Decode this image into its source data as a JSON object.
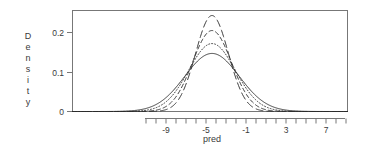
{
  "chart_data": {
    "type": "line",
    "title": "",
    "subtitle": "",
    "xlabel": "pred",
    "ylabel": "Density",
    "ylabel_letters": [
      "D",
      "e",
      "n",
      "s",
      "i",
      "t",
      "y"
    ],
    "xlim": [
      -12.5,
      15.1
    ],
    "ylim": [
      0,
      0.255
    ],
    "grid": false,
    "legend": null,
    "x_ticks_labeled": [
      -9,
      -5,
      -1,
      3,
      7
    ],
    "x_tick_labels": [
      "-9",
      "-5",
      "-1",
      "3",
      "7"
    ],
    "x_ticks_minor": [
      -11,
      -10,
      -8,
      -7,
      -6,
      -4,
      -3,
      -2,
      0,
      1,
      2,
      4,
      5,
      6,
      8,
      9
    ],
    "y_ticks": [
      0,
      0.1,
      0.2
    ],
    "y_tick_labels": [
      "0",
      "0.1",
      "0.2"
    ],
    "axis_color": "#555555",
    "line_color": "#2b2b2b",
    "series": [
      {
        "name": "curve-1-solid",
        "linestyle": "solid",
        "dash": "none",
        "peak_x": -4.4,
        "peak_y": 0.147,
        "sigma": 2.72,
        "points_x": [
          -12.5,
          -11.5,
          -10.5,
          -9.5,
          -8.5,
          -7.5,
          -6.5,
          -5.5,
          -4.4,
          -3.5,
          -2.5,
          -1.5,
          -0.5,
          0.5,
          1.5,
          2.5,
          3.5,
          4.5,
          5.5,
          6.5,
          7.5,
          8.5,
          9.5
        ],
        "points_y": [
          0.0027,
          0.0052,
          0.0093,
          0.0156,
          0.0244,
          0.0356,
          0.0484,
          0.0615,
          0.0147,
          0.0828,
          0.0862,
          0.0826,
          0.0731,
          0.0601,
          0.0459,
          0.0326,
          0.0215,
          0.0132,
          0.0075,
          0.004,
          0.002,
          0.0009,
          0.0004
        ]
      },
      {
        "name": "curve-2-dotted",
        "linestyle": "dotted",
        "dash": "1,2",
        "peak_x": -4.4,
        "peak_y": 0.172,
        "sigma": 2.33
      },
      {
        "name": "curve-3-dashed",
        "linestyle": "dashed",
        "dash": "4,3",
        "peak_x": -4.4,
        "peak_y": 0.205,
        "sigma": 1.95
      },
      {
        "name": "curve-4-longdash",
        "linestyle": "longdash",
        "dash": "7,4",
        "peak_x": -4.4,
        "peak_y": 0.243,
        "sigma": 1.64
      }
    ]
  },
  "figure": {
    "background": "#ffffff",
    "frame_visible": true
  }
}
